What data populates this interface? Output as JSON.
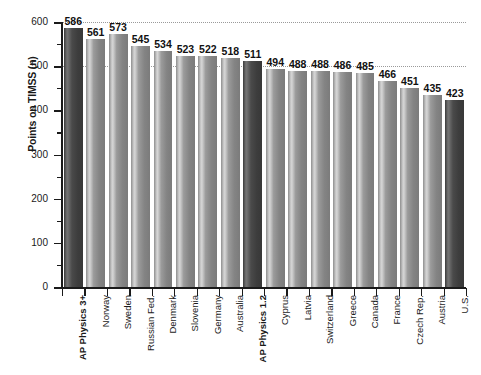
{
  "chart_data": {
    "type": "bar",
    "title": "",
    "subtitle": "",
    "xlabel": "",
    "ylabel": "Points on TIMSS (n)",
    "ylim": [
      0,
      600
    ],
    "ytick_step": 100,
    "yminor_step": 50,
    "ytick_labels": [
      "0",
      "100",
      "200",
      "300",
      "400",
      "500",
      "600"
    ],
    "ytick_values": [
      0,
      100,
      200,
      300,
      400,
      500,
      600
    ],
    "grid": "horizontal-dotted",
    "gridline_values": [
      500,
      600
    ],
    "legend": "none",
    "orientation": "vertical",
    "categories": [
      "AP Physics 3+",
      "Norway",
      "Sweden",
      "Russian Fed.",
      "Denmark",
      "Slovenia",
      "Germany",
      "Australia",
      "AP Physics 1.2",
      "Cyprus",
      "Latvia",
      "Switzerland",
      "Greece",
      "Canada",
      "France",
      "Czech Rep.",
      "Austria",
      "U.S."
    ],
    "values": [
      586,
      561,
      573,
      545,
      534,
      523,
      522,
      518,
      511,
      494,
      488,
      488,
      486,
      485,
      466,
      451,
      435,
      423
    ],
    "value_labels": [
      "586",
      "561",
      "573",
      "545",
      "534",
      "523",
      "522",
      "518",
      "511",
      "494",
      "488",
      "488",
      "486",
      "485",
      "466",
      "451",
      "435",
      "423"
    ],
    "highlighted": [
      true,
      false,
      false,
      false,
      false,
      false,
      false,
      false,
      true,
      false,
      false,
      false,
      false,
      false,
      false,
      false,
      false,
      true
    ],
    "bold_category_labels": [
      true,
      false,
      false,
      false,
      false,
      false,
      false,
      false,
      true,
      false,
      false,
      false,
      false,
      false,
      false,
      false,
      false,
      false
    ],
    "colors": {
      "bar_light": "#9b9b9b",
      "bar_dark": "#3f3f3f",
      "axis": "#1a1a1a",
      "gridline": "#9a9a9a",
      "text": "#1a1a1a",
      "background": "#ffffff"
    }
  }
}
